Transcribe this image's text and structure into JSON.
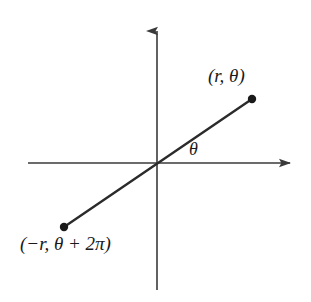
{
  "figure": {
    "type": "polar-coordinates-diagram",
    "background_color": "#ffffff",
    "stroke_color": "#2b2b2b",
    "axis_color": "#3a3a3a"
  },
  "axes": {
    "x_axis": {
      "name": "horizontal-axis",
      "start_x": 28,
      "end_x": 296,
      "y": 163,
      "arrow": "right"
    },
    "y_axis": {
      "name": "vertical-axis",
      "x": 157,
      "start_y": 290,
      "end_y": 25,
      "arrow": "up"
    },
    "origin": {
      "x": 157,
      "y": 163
    }
  },
  "ray": {
    "name": "point-ray-line",
    "from": {
      "x": 64,
      "y": 227
    },
    "to": {
      "x": 252,
      "y": 99
    },
    "passes_through_origin": true,
    "stroke_width": 2.4
  },
  "points": [
    {
      "name": "upper-right-point",
      "x": 252,
      "y": 99,
      "radius": 4.2,
      "label": "(r, θ)"
    },
    {
      "name": "lower-left-point",
      "x": 64,
      "y": 227,
      "radius": 4.2,
      "label": "(−r, θ + 2π)"
    }
  ],
  "labels": {
    "upper_point": "(r, θ)",
    "lower_point": "(−r, θ + 2π)",
    "angle": "θ"
  }
}
